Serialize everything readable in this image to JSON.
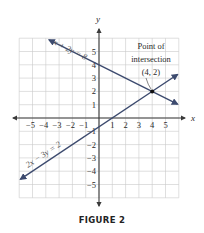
{
  "chart_data": {
    "type": "line",
    "title": "",
    "caption": "FIGURE 2",
    "xlabel": "x",
    "ylabel": "y",
    "xlim": [
      -6,
      6
    ],
    "ylim": [
      -6,
      6
    ],
    "grid": true,
    "x_ticks": [
      "-5",
      "-4",
      "-3",
      "-2",
      "-1",
      "1",
      "2",
      "3",
      "4",
      "5"
    ],
    "y_ticks": [
      "5",
      "4",
      "3",
      "2",
      "1",
      "-1",
      "-2",
      "-3",
      "-4",
      "-5"
    ],
    "series": [
      {
        "name": "x + 2y = 8",
        "equation": "x + 2y = 8",
        "x": [
          -3.75,
          5.9
        ],
        "y": [
          5.875,
          1.05
        ]
      },
      {
        "name": "2x - 3y = 2",
        "equation": "2x − 3y = 2",
        "x": [
          -5.9,
          5.9
        ],
        "y": [
          -4.6,
          3.27
        ]
      }
    ],
    "annotations": [
      {
        "text_line1": "Point of",
        "text_line2": "intersection",
        "text_line3": "(4, 2)",
        "x": 4,
        "y": 2
      }
    ]
  },
  "labels": {
    "x_axis": "x",
    "y_axis": "y",
    "line1": "x + 2y = 8",
    "line2": "2x − 3y = 2",
    "annot1": "Point of",
    "annot2": "intersection",
    "annot3": "(4, 2)",
    "caption": "FIGURE 2"
  }
}
